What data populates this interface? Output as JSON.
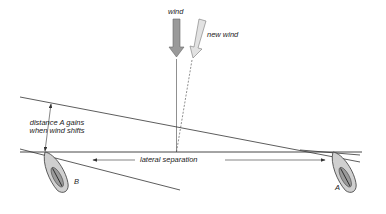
{
  "diagram": {
    "labels": {
      "wind": "wind",
      "new_wind": "new wind",
      "distance_line1": "distance A gains",
      "distance_line2": "when wind shifts",
      "lateral_separation": "lateral separation",
      "boat_a": "A",
      "boat_b": "B"
    },
    "colors": {
      "line": "#333333",
      "wind_arrow": "#9a9a9a",
      "new_wind_arrow": "#d8d8d8",
      "boat_hull": "#c8c8c8"
    }
  }
}
